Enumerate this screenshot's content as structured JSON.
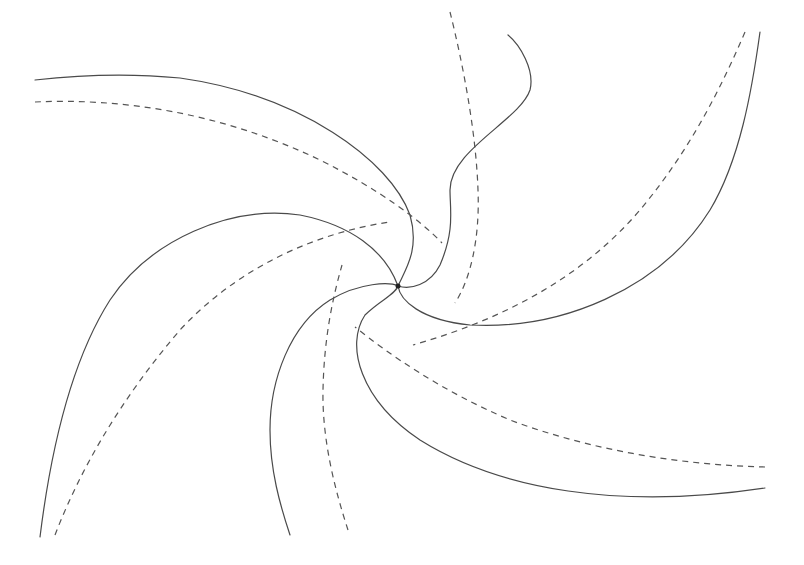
{
  "figure": {
    "background": "#ffffff",
    "stroke_color": "#4a4a4a",
    "center": {
      "x": 398,
      "y": 286
    },
    "solid_arms": [
      {
        "id": "arm-1",
        "d": "M398 286 C 405 270, 420 250, 410 215 C 390 160, 300 95, 180 78 C 120 72, 70 76, 35 80"
      },
      {
        "id": "arm-2",
        "d": "M398 286 C 385 250, 350 225, 300 215 C 230 205, 150 240, 110 300 C 75 355, 52 440, 40 537"
      },
      {
        "id": "arm-3",
        "d": "M398 286 C 390 282, 360 282, 330 300 C 290 325, 270 380, 270 430 C 270 470, 280 505, 290 535"
      },
      {
        "id": "arm-4",
        "d": "M398 286 C 395 295, 380 300, 365 315 C 345 345, 360 400, 420 440 C 500 490, 620 510, 765 488"
      },
      {
        "id": "arm-5",
        "d": "M398 286 C 400 300, 420 320, 470 325 C 560 330, 660 290, 710 210 C 740 160, 752 90, 760 32"
      },
      {
        "id": "arm-6",
        "d": "M398 286 C 410 290, 430 285, 440 265 C 455 230, 450 210, 450 190 C 450 150, 520 120, 530 90 C 535 70, 520 45, 508 35"
      }
    ],
    "dashed_curves": [
      {
        "id": "dash-1",
        "d": "M35 102 C 120 98, 220 112, 320 160 C 380 190, 420 220, 442 243"
      },
      {
        "id": "dash-2",
        "d": "M450 12 C 462 60, 476 130, 478 190 C 480 240, 470 280, 455 303"
      },
      {
        "id": "dash-3",
        "d": "M745 32 C 720 90, 690 150, 640 210 C 580 280, 500 320, 413 345"
      },
      {
        "id": "dash-4",
        "d": "M765 467 C 680 465, 590 450, 510 420 C 440 390, 390 355, 355 327"
      },
      {
        "id": "dash-5",
        "d": "M348 530 C 335 490, 322 440, 323 390 C 324 340, 332 300, 342 265"
      },
      {
        "id": "dash-6",
        "d": "M55 535 C 80 470, 120 400, 180 330 C 240 265, 320 232, 390 222"
      }
    ]
  }
}
